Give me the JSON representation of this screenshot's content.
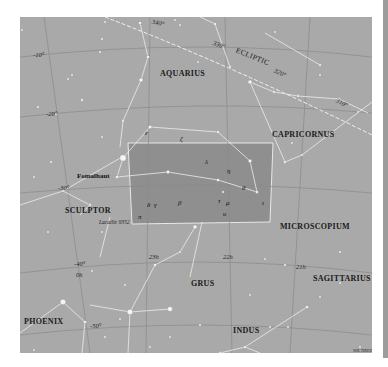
{
  "map": {
    "background_color": "#a9a9a9",
    "highlight_color": "#8e8e8e",
    "highlight_constellation": "Piscis Austrinus",
    "constellations": [
      {
        "name": "AQUARIUS"
      },
      {
        "name": "CAPRICORNUS"
      },
      {
        "name": "SCULPTOR"
      },
      {
        "name": "MICROSCOPIUM"
      },
      {
        "name": "GRUS"
      },
      {
        "name": "SAGITTARIUS"
      },
      {
        "name": "PHOENIX"
      },
      {
        "name": "INDUS"
      }
    ],
    "ecliptic": {
      "label": "ECLIPTIC",
      "marks": [
        "340°",
        "330°",
        "320°",
        "310°"
      ]
    },
    "declination_labels": [
      "-10°",
      "-20°",
      "-30°",
      "-40°",
      "-50°"
    ],
    "right_ascension_labels": [
      "0h",
      "23h",
      "22h",
      "21h"
    ],
    "named_stars": [
      "Fomalhaut",
      "Lacaille 9352"
    ],
    "greek_labels": [
      "ε",
      "ζ",
      "λ",
      "η",
      "θ",
      "ι",
      "μ",
      "β",
      "δ",
      "γ",
      "π",
      "τ",
      "υ"
    ],
    "credit": "WIL TIRION"
  }
}
